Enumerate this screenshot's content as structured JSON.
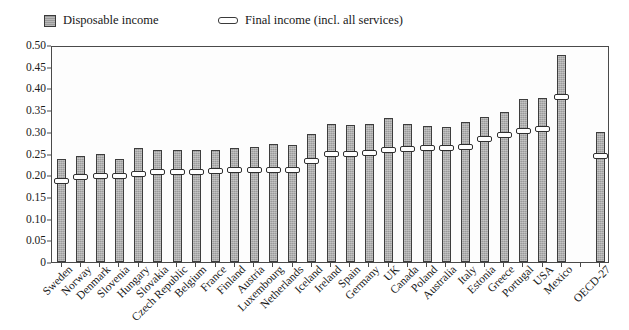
{
  "legend": {
    "items": [
      {
        "label": "Disposable income",
        "icon": "filled-square-swatch-icon",
        "color": "#9b9b9b"
      },
      {
        "label": "Final income (incl. all services)",
        "icon": "hollow-bar-marker-icon",
        "color": "#ffffff"
      }
    ]
  },
  "axes": {
    "y_ticks": [
      "0",
      "0.05",
      "0.10",
      "0.15",
      "0.20",
      "0.25",
      "0.30",
      "0.35",
      "0.40",
      "0.45",
      "0.50"
    ],
    "y_min": 0,
    "y_max": 0.5
  },
  "chart_data": {
    "type": "bar",
    "title": "",
    "subtitle": "",
    "xlabel": "",
    "ylabel": "",
    "ylim": [
      0,
      0.5
    ],
    "ytick_step": 0.05,
    "grid": false,
    "legend_position": "top",
    "categories": [
      "Sweden",
      "Norway",
      "Denmark",
      "Slovenia",
      "Hungary",
      "Slovakia",
      "Czech Republic",
      "Belgium",
      "France",
      "Finland",
      "Austria",
      "Luxembourg",
      "Netherlands",
      "Iceland",
      "Ireland",
      "Spain",
      "Germany",
      "UK",
      "Canada",
      "Poland",
      "Australia",
      "Italy",
      "Estonia",
      "Greece",
      "Portugal",
      "USA",
      "Mexico",
      "",
      "OECD-27"
    ],
    "series": [
      {
        "name": "Disposable income",
        "values": [
          0.237,
          0.245,
          0.248,
          0.237,
          0.262,
          0.257,
          0.259,
          0.259,
          0.259,
          0.262,
          0.266,
          0.271,
          0.27,
          0.294,
          0.318,
          0.316,
          0.318,
          0.332,
          0.318,
          0.314,
          0.311,
          0.322,
          0.335,
          0.346,
          0.376,
          0.379,
          0.477,
          null,
          0.3
        ]
      },
      {
        "name": "Final income (incl. all services)",
        "values": [
          0.186,
          0.196,
          0.198,
          0.199,
          0.203,
          0.208,
          0.208,
          0.208,
          0.21,
          0.211,
          0.212,
          0.212,
          0.213,
          0.233,
          0.248,
          0.25,
          0.251,
          0.258,
          0.261,
          0.263,
          0.262,
          0.265,
          0.284,
          0.292,
          0.301,
          0.307,
          0.38,
          null,
          0.244
        ]
      }
    ]
  }
}
